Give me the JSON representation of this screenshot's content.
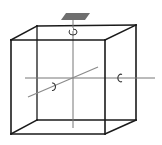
{
  "diagram": {
    "colors": {
      "edges": "#1a1a1a",
      "axes": "#777777",
      "diagonal_axis": "#8a8a8a",
      "plate": "#6f6f6f",
      "background": "#ffffff"
    },
    "cube": {
      "front_face": {
        "top_left": [
          11,
          40
        ],
        "top_right": [
          105,
          40
        ],
        "bottom_right": [
          105,
          134
        ],
        "bottom_left": [
          11,
          134
        ]
      },
      "back_face": {
        "top_left": [
          37,
          26
        ],
        "top_right": [
          136,
          25
        ],
        "bottom_right": [
          136,
          120
        ],
        "bottom_left": [
          37,
          120
        ]
      }
    },
    "axes": [
      {
        "name": "vertical",
        "from": [
          73,
          20
        ],
        "to": [
          73,
          128
        ],
        "rotation_symbol": "↻",
        "symbol_pos": [
          73,
          32
        ]
      },
      {
        "name": "horizontal",
        "from": [
          25,
          78
        ],
        "to": [
          155,
          78
        ],
        "rotation_symbol": "C",
        "symbol_pos": [
          120,
          78
        ]
      },
      {
        "name": "diagonal",
        "from": [
          28,
          97
        ],
        "to": [
          98,
          67
        ],
        "rotation_symbol": "Ɔ",
        "symbol_pos": [
          53,
          87
        ]
      }
    ],
    "top_plate": {
      "points": [
        [
          61,
          20
        ],
        [
          66,
          13
        ],
        [
          90,
          13
        ],
        [
          85,
          20
        ]
      ]
    }
  }
}
